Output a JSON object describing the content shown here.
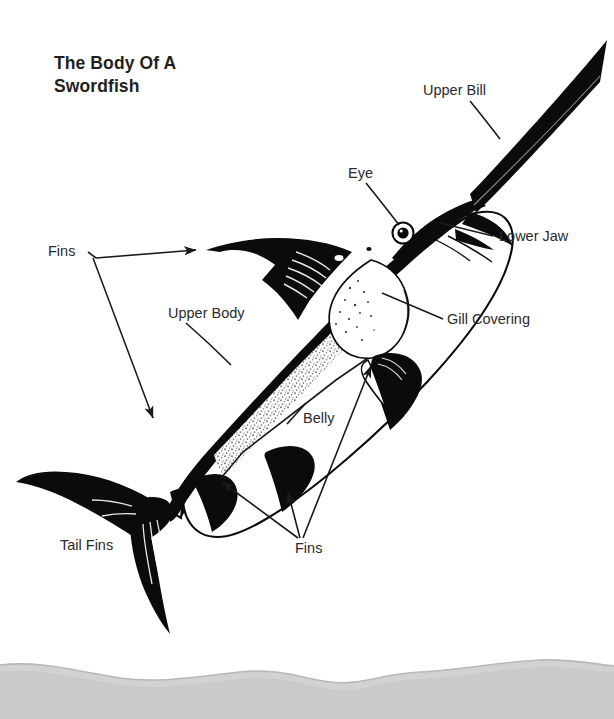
{
  "document": {
    "title": "The Body Of A Swordfish",
    "title_lines": [
      "The Body Of A",
      "Swordfish"
    ],
    "subject": "swordfish-anatomy-diagram",
    "background_color": "#ffffff",
    "ink_color": "#000000",
    "text_color": "#2b2b2b"
  },
  "labels": {
    "upper_bill": "Upper Bill",
    "eye": "Eye",
    "lower_jaw": "Lower Jaw",
    "fins_top": "Fins",
    "upper_body": "Upper Body",
    "gill_covering": "Gill Covering",
    "belly": "Belly",
    "tail_fins": "Tail Fins",
    "fins_bottom": "Fins"
  },
  "label_list": [
    {
      "id": "upper-bill",
      "text": "Upper Bill",
      "x": 423,
      "y": 83,
      "leader": "down-right"
    },
    {
      "id": "eye",
      "text": "Eye",
      "x": 348,
      "y": 166,
      "leader": "down-right"
    },
    {
      "id": "lower-jaw",
      "text": "Lower Jaw",
      "x": 499,
      "y": 229,
      "leader": "left"
    },
    {
      "id": "fins-top",
      "text": "Fins",
      "x": 48,
      "y": 244,
      "leader": "two-arrows"
    },
    {
      "id": "upper-body",
      "text": "Upper Body",
      "x": 168,
      "y": 306,
      "leader": "down-right"
    },
    {
      "id": "gill-covering",
      "text": "Gill Covering",
      "x": 447,
      "y": 312,
      "leader": "up-left"
    },
    {
      "id": "belly",
      "text": "Belly",
      "x": 303,
      "y": 411,
      "leader": "tick-line"
    },
    {
      "id": "tail-fins",
      "text": "Tail Fins",
      "x": 60,
      "y": 538,
      "leader": "none"
    },
    {
      "id": "fins-bottom",
      "text": "Fins",
      "x": 295,
      "y": 541,
      "leader": "three-arrows"
    }
  ],
  "figure": {
    "type": "line-art-illustration",
    "species": "swordfish",
    "orientation": "diagonal, head upper-right, tail lower-left",
    "parts": [
      "upper bill",
      "lower jaw",
      "eye",
      "gill covering",
      "dorsal fin",
      "pectoral fin",
      "pelvic fin",
      "anal fin",
      "upper body",
      "belly",
      "tail fins"
    ]
  },
  "page_edge": {
    "present": true,
    "description": "scanned torn page edge shadow along bottom",
    "color": "#cfcfcf"
  }
}
